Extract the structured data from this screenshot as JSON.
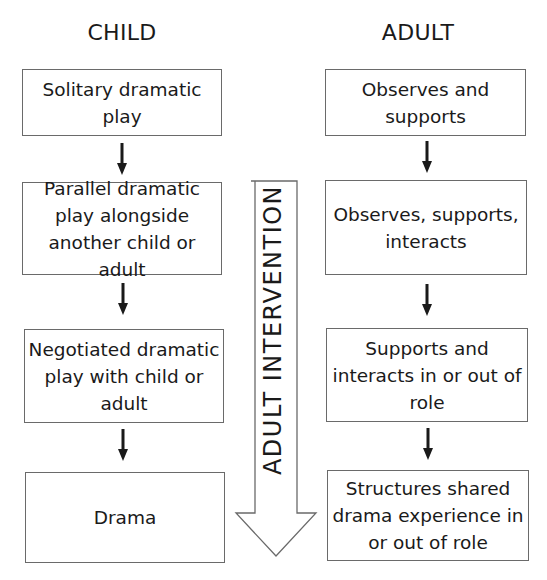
{
  "headers": {
    "child": "CHILD",
    "adult": "ADULT"
  },
  "child_boxes": [
    {
      "label": "Solitary dramatic play"
    },
    {
      "label": "Parallel dramatic play alongside another child or adult"
    },
    {
      "label": "Negotiated dramatic play with child or adult"
    },
    {
      "label": "Drama"
    }
  ],
  "adult_boxes": [
    {
      "label": "Observes and supports"
    },
    {
      "label": "Observes, supports, interacts"
    },
    {
      "label": "Supports and interacts in or out of role"
    },
    {
      "label": "Structures shared drama experience in or out of role"
    }
  ],
  "center_arrow": {
    "label": "ADULT INTERVENTION",
    "direction": "down"
  },
  "colors": {
    "box_border": "#6a6a6a",
    "arrow_fill": "#1a1a1a",
    "text": "#1a1a1a"
  }
}
